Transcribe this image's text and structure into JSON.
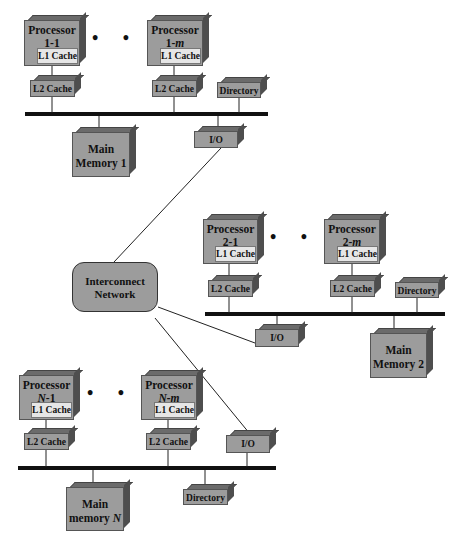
{
  "diagram": {
    "type": "multiprocessor-ccnuma-organization",
    "colors": {
      "box_front": "#9c9c9c",
      "box_top": "#6b6b6b",
      "box_side": "#4e4e4e",
      "l1_cache": "#e6e6e6",
      "bus": "#111111",
      "background": "#ffffff"
    },
    "ellipsis": "• • •",
    "node1": {
      "proc_a": {
        "line1": "Processor",
        "line2": "1-1",
        "l1": "L1 Cache"
      },
      "proc_b": {
        "line1": "Processor",
        "line2_prefix": "1-",
        "line2_italic": "m",
        "l1": "L1 Cache"
      },
      "l2_a": "L2 Cache",
      "l2_b": "L2 Cache",
      "directory": "Directory",
      "io": "I/O",
      "memory": {
        "line1": "Main",
        "line2": "Memory 1"
      }
    },
    "node2": {
      "proc_a": {
        "line1": "Processor",
        "line2": "2-1",
        "l1": "L1 Cache"
      },
      "proc_b": {
        "line1": "Processor",
        "line2_prefix": "2-",
        "line2_italic": "m",
        "l1": "L1 Cache"
      },
      "l2_a": "L2 Cache",
      "l2_b": "L2 Cache",
      "directory": "Directory",
      "io": "I/O",
      "memory": {
        "line1": "Main",
        "line2": "Memory 2"
      }
    },
    "nodeN": {
      "proc_a": {
        "line1": "Processor",
        "line2_italic": "N",
        "line2_suffix": "-1",
        "l1": "L1 Cache"
      },
      "proc_b": {
        "line1": "Processor",
        "line2_italic": "N-m",
        "l1": "L1 Cache"
      },
      "l2_a": "L2 Cache",
      "l2_b": "L2 Cache",
      "directory": "Directory",
      "io": "I/O",
      "memory": {
        "line1": "Main",
        "line2_prefix": "memory ",
        "line2_italic": "N"
      }
    },
    "network": {
      "line1": "Interconnect",
      "line2": "Network"
    }
  }
}
